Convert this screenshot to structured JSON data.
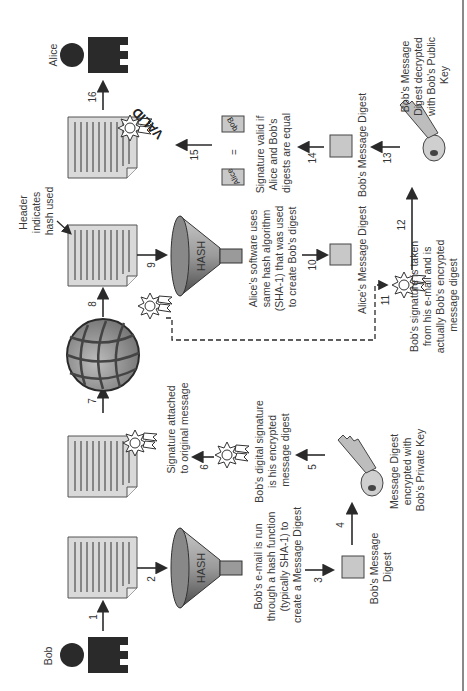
{
  "actors": {
    "sender": "Bob",
    "receiver": "Alice"
  },
  "hash_label": "HASH",
  "stamp_label": "VALID",
  "compare": {
    "left": "Alice",
    "equals": "=",
    "right": "Bob"
  },
  "steps": [
    "1",
    "2",
    "3",
    "4",
    "5",
    "6",
    "7",
    "8",
    "9",
    "10",
    "11",
    "12",
    "13",
    "14",
    "15",
    "16"
  ],
  "captions": {
    "hash_bob": [
      "Bob's e-mail is run",
      "through a hash function",
      "(typically SHA-1) to",
      "create a Message Digest"
    ],
    "bob_digest": [
      "Bob's Message",
      "Digest"
    ],
    "private_key": [
      "Message Digest",
      "encrypted with",
      "Bob's Private Key"
    ],
    "digital_signature": [
      "Bob's digital signature",
      "is his encrypted",
      "message digest"
    ],
    "signature_attached": [
      "Signature attached",
      "to original message"
    ],
    "header": [
      "Header",
      "indicates",
      "hash used"
    ],
    "alice_software": [
      "Alice's software uses",
      "same hash algorithm",
      "(SHA-1) that was used",
      "to create Bob's digest"
    ],
    "alice_digest": [
      "Alice's Message Digest"
    ],
    "signature_taken": [
      "Bob's signature is taken",
      "from his e-mail and is",
      "actually Bob's encrypted",
      "message digest"
    ],
    "bob_digest_right": [
      "Bob's Message Digest"
    ],
    "public_key": [
      "Bob's Message",
      "Digest decrypted",
      "with Bob's Public",
      "Key"
    ],
    "signature_valid": [
      "Signature valid if",
      "Alice and Bob's",
      "digests are equal"
    ]
  },
  "colors": {
    "ink": "#2a2a2a",
    "paper": "#d9d9d9",
    "box": "#c8c8c8",
    "edge": "#8a8a8a"
  }
}
